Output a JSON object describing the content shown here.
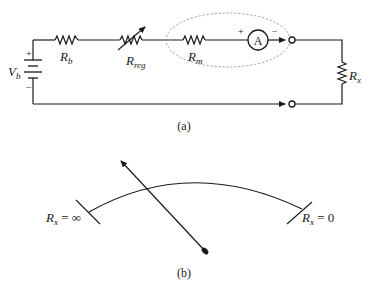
{
  "figure_a": {
    "caption": "(a)",
    "battery": {
      "label_main": "V",
      "label_sub": "b",
      "plus": "+",
      "minus": "−"
    },
    "resistor_b": {
      "label_main": "R",
      "label_sub": "b"
    },
    "resistor_reg": {
      "label_main": "R",
      "label_sub": "reg"
    },
    "resistor_m": {
      "label_main": "R",
      "label_sub": "m"
    },
    "ammeter": {
      "symbol": "A",
      "plus": "+",
      "minus": "−"
    },
    "resistor_x": {
      "label_main": "R",
      "label_sub": "x"
    }
  },
  "figure_b": {
    "caption": "(b)",
    "left_scale_label": {
      "main": "R",
      "sub": "x",
      "rest": " = ∞"
    },
    "right_scale_label": {
      "main": "R",
      "sub": "x",
      "rest": " = 0"
    }
  },
  "colors": {
    "ink": "#1a1a1a",
    "dashed": "#888888",
    "background": "#ffffff"
  }
}
